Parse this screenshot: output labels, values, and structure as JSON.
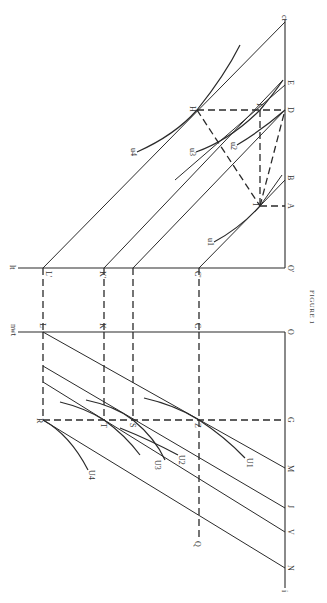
{
  "figure": {
    "caption": "FIGURE 1",
    "orientation": "rotated 90° clockwise",
    "upper_panel": {
      "vertical_axis_label": "ct",
      "horizontal_axis_label": "lt",
      "origin_label": "O'",
      "axis_points": [
        "A",
        "B",
        "D",
        "E"
      ],
      "horizontal_points": [
        "L'",
        "K'",
        "C'"
      ],
      "interior_points": [
        "H",
        "F",
        "I"
      ],
      "indifference_curves": [
        "u1",
        "u2",
        "u3",
        "u4"
      ]
    },
    "lower_panel": {
      "vertical_axis_label": "i",
      "horizontal_axis_label": "nwt",
      "origin_label": "O",
      "axis_points": [
        "G",
        "M",
        "J",
        "V",
        "N"
      ],
      "horizontal_points": [
        "L",
        "K",
        "C"
      ],
      "interior_points": [
        "R",
        "T",
        "S",
        "Z",
        "Q"
      ],
      "indifference_curves": [
        "U1",
        "U2",
        "U3",
        "U4"
      ]
    }
  },
  "labels": {
    "ct": "ct",
    "E": "E",
    "D": "D",
    "B": "B",
    "A": "A",
    "H": "H",
    "F": "F",
    "I": "I",
    "u1": "u1",
    "u2": "u2",
    "u3": "u3",
    "u4": "u4",
    "lt": "lt",
    "Lp": "L'",
    "Kp": "K'",
    "Cp": "C'",
    "Op": "O'",
    "nwt": "nwt",
    "L": "L",
    "K": "K",
    "C": "C",
    "O": "O",
    "R": "R",
    "T": "T",
    "S": "S",
    "Z": "Z",
    "G": "G",
    "U1": "U1",
    "U2": "U2",
    "U3": "U3",
    "U4": "U4",
    "M": "M",
    "J": "J",
    "V": "V",
    "N": "N",
    "Q": "Q",
    "i": "i"
  }
}
